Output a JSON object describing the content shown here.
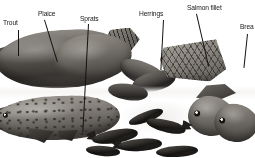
{
  "plate": {
    "title": "Fish varieties",
    "background_color": "#ffffff",
    "label_color": "#1a1817",
    "leader_color": "#15130f",
    "width": 255,
    "height": 158
  },
  "labels": [
    {
      "id": "trout",
      "text": "Trout"
    },
    {
      "id": "plaice",
      "text": "Plaice"
    },
    {
      "id": "sprats",
      "text": "Sprats"
    },
    {
      "id": "herrings",
      "text": "Herrings"
    },
    {
      "id": "salmon-fillet",
      "text": "Salmon fillet"
    },
    {
      "id": "bream",
      "text": "Brea"
    }
  ],
  "specimens": [
    {
      "id": "salmon-whole",
      "name": "whole salmon"
    },
    {
      "id": "trout-whole",
      "name": "speckled trout"
    },
    {
      "id": "plaice",
      "name": "plaice"
    },
    {
      "id": "herrings",
      "name": "herrings"
    },
    {
      "id": "fillet",
      "name": "salmon fillet slab"
    },
    {
      "id": "sprats",
      "name": "sprats"
    },
    {
      "id": "bream",
      "name": "bream pair"
    }
  ]
}
